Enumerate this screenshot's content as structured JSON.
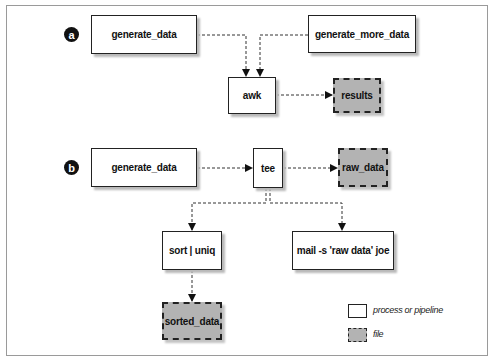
{
  "diagram": {
    "type": "pipeline-flow",
    "panels": [
      {
        "marker": "a",
        "nodes": [
          {
            "id": "a_generate_data",
            "label": "generate_data",
            "kind": "process"
          },
          {
            "id": "a_generate_more_data",
            "label": "generate_more_data",
            "kind": "process"
          },
          {
            "id": "a_awk",
            "label": "awk",
            "kind": "process"
          },
          {
            "id": "a_results",
            "label": "results",
            "kind": "file"
          }
        ],
        "edges": [
          {
            "from": "a_generate_data",
            "to": "a_awk"
          },
          {
            "from": "a_generate_more_data",
            "to": "a_awk"
          },
          {
            "from": "a_awk",
            "to": "a_results"
          }
        ]
      },
      {
        "marker": "b",
        "nodes": [
          {
            "id": "b_generate_data",
            "label": "generate_data",
            "kind": "process"
          },
          {
            "id": "b_tee",
            "label": "tee",
            "kind": "process"
          },
          {
            "id": "b_raw_data",
            "label": "raw_data",
            "kind": "file"
          },
          {
            "id": "b_sort_uniq",
            "label": "sort | uniq",
            "kind": "process"
          },
          {
            "id": "b_mail",
            "label": "mail -s 'raw data' joe",
            "kind": "process"
          },
          {
            "id": "b_sorted_data",
            "label": "sorted_data",
            "kind": "file"
          }
        ],
        "edges": [
          {
            "from": "b_generate_data",
            "to": "b_tee"
          },
          {
            "from": "b_tee",
            "to": "b_raw_data"
          },
          {
            "from": "b_tee",
            "to": "b_sort_uniq"
          },
          {
            "from": "b_tee",
            "to": "b_mail"
          },
          {
            "from": "b_sort_uniq",
            "to": "b_sorted_data"
          }
        ]
      }
    ],
    "legend": [
      {
        "kind": "process",
        "label": "process or pipeline"
      },
      {
        "kind": "file",
        "label": "file"
      }
    ],
    "colors": {
      "process_fill": "#ffffff",
      "file_fill": "#b3b3b3",
      "stroke": "#222222",
      "marker_fill": "#111111"
    }
  }
}
